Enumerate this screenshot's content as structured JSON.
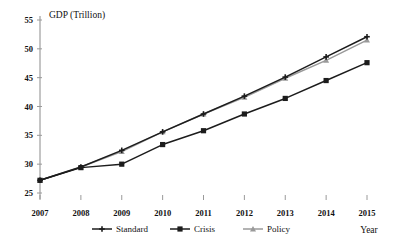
{
  "chart_data": {
    "type": "line",
    "title": "GDP (Trillion)",
    "xlabel": "Year",
    "ylabel": "GDP (Trillion)",
    "categories": [
      "2007",
      "2008",
      "2009",
      "2010",
      "2011",
      "2012",
      "2013",
      "2014",
      "2015"
    ],
    "x": [
      2007,
      2008,
      2009,
      2010,
      2011,
      2012,
      2013,
      2014,
      2015
    ],
    "xlim": [
      2007,
      2015
    ],
    "ylim": [
      25,
      55
    ],
    "yticks": [
      25,
      30,
      35,
      40,
      45,
      50,
      55
    ],
    "grid": false,
    "legend_position": "bottom",
    "series": [
      {
        "name": "Standard",
        "color": "#1c1c1c",
        "marker": "cross",
        "values": [
          27.2,
          29.5,
          32.4,
          35.6,
          38.7,
          41.8,
          45.1,
          48.6,
          52.1
        ]
      },
      {
        "name": "Crisis",
        "color": "#1c1c1c",
        "marker": "square",
        "values": [
          27.2,
          29.4,
          30.0,
          33.4,
          35.8,
          38.7,
          41.4,
          44.5,
          47.6
        ]
      },
      {
        "name": "Policy",
        "color": "#9a9a9a",
        "marker": "triangle",
        "values": [
          27.2,
          29.5,
          32.2,
          35.6,
          38.7,
          41.6,
          44.9,
          48.0,
          51.5
        ]
      }
    ]
  },
  "axis": {
    "y_title": "GDP (Trillion)",
    "x_title": "Year",
    "y_labels": [
      "55",
      "50",
      "45",
      "40",
      "35",
      "30",
      "25"
    ],
    "x_labels": [
      "2007",
      "2008",
      "2009",
      "2010",
      "2011",
      "2012",
      "2013",
      "2014",
      "2015"
    ]
  },
  "legend": {
    "items": [
      {
        "label": "Standard"
      },
      {
        "label": "Crisis"
      },
      {
        "label": "Policy"
      }
    ]
  }
}
